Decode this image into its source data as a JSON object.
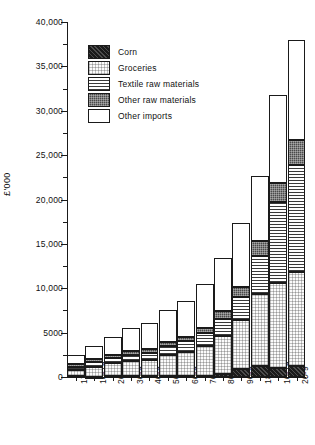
{
  "chart_data": {
    "type": "bar",
    "stacked": true,
    "title": "",
    "xlabel": "",
    "ylabel": "£'000",
    "ylim": [
      0,
      40000
    ],
    "ytick_step": 5000,
    "yticks": [
      0,
      5000,
      10000,
      15000,
      20000,
      25000,
      30000,
      35000,
      40000
    ],
    "ytick_labels": [
      "0",
      "5000",
      "10,000",
      "15,000",
      "20,000",
      "25,000",
      "30,000",
      "35,000",
      "40,000"
    ],
    "minor_ytick_step": 2500,
    "grid": false,
    "legend_position": "upper-left-inside",
    "categories": [
      "1700-9",
      "10-19",
      "20-9",
      "30-9",
      "40-9",
      "50-9",
      "60-9",
      "70-9",
      "80-9",
      "90-9",
      "1800-9",
      "10-19",
      "20-9"
    ],
    "series": [
      {
        "name": "Corn",
        "pattern": "corn",
        "values": [
          60,
          40,
          60,
          80,
          60,
          100,
          120,
          150,
          350,
          900,
          1200,
          1050,
          1250
        ]
      },
      {
        "name": "Groceries",
        "pattern": "groceries",
        "values": [
          700,
          1100,
          1500,
          1750,
          1900,
          2400,
          2700,
          3300,
          4300,
          5500,
          8100,
          9500,
          10600
        ]
      },
      {
        "name": "Textile raw materials",
        "pattern": "textile",
        "values": [
          400,
          550,
          600,
          700,
          800,
          950,
          1200,
          1500,
          1900,
          2600,
          4300,
          9200,
          12000
        ]
      },
      {
        "name": "Other raw materials",
        "pattern": "otherraw",
        "values": [
          250,
          300,
          300,
          350,
          400,
          450,
          500,
          600,
          900,
          1100,
          1700,
          2150,
          2800
        ]
      },
      {
        "name": "Other imports",
        "pattern": "otherimports",
        "values": [
          1090,
          1510,
          2040,
          2620,
          2940,
          3600,
          4080,
          4950,
          5950,
          7200,
          7400,
          9900,
          11350
        ]
      }
    ],
    "totals": [
      2500,
      3500,
      4500,
      5500,
      6100,
      7500,
      8600,
      10500,
      13400,
      17300,
      22700,
      31800,
      38000
    ]
  },
  "legend": {
    "items": [
      {
        "label": "Corn"
      },
      {
        "label": "Groceries"
      },
      {
        "label": "Textile raw materials"
      },
      {
        "label": "Other raw materials"
      },
      {
        "label": "Other imports"
      }
    ]
  }
}
